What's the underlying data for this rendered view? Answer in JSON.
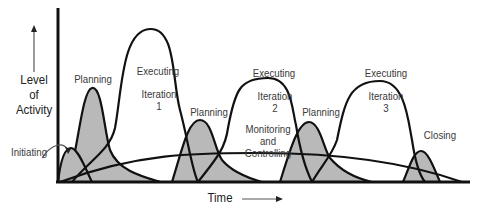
{
  "diagram": {
    "type": "project-lifecycle-activity-curves",
    "y_axis_label": "Level\nof\nActivity",
    "x_axis_label": "Time",
    "phases": [
      {
        "id": "initiating",
        "label": "Initiating",
        "shaded": true
      },
      {
        "id": "planning-1",
        "label": "Planning",
        "shaded": true
      },
      {
        "id": "executing-1",
        "label": "Executing",
        "sublabel": "Iteration\n1",
        "shaded": false
      },
      {
        "id": "planning-2",
        "label": "Planning",
        "shaded": true
      },
      {
        "id": "executing-2",
        "label": "Executing",
        "sublabel": "Iteration\n2",
        "shaded": false
      },
      {
        "id": "monitoring-controlling",
        "label": "Monitoring\nand\nControlling",
        "shaded": false
      },
      {
        "id": "planning-3",
        "label": "Planning",
        "shaded": true
      },
      {
        "id": "executing-3",
        "label": "Executing",
        "sublabel": "Iteration\n3",
        "shaded": false
      },
      {
        "id": "closing",
        "label": "Closing",
        "shaded": true
      }
    ],
    "colors": {
      "stroke": "#111111",
      "shade": "#b9b9b9",
      "text": "#3a3a3a",
      "background": "#ffffff"
    }
  }
}
